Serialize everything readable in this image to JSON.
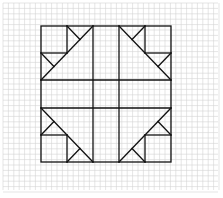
{
  "figure": {
    "background": "#ffffff",
    "grid_color": "#d4d4d4",
    "line_color": "#111111",
    "grid_spacing": 5.4
  },
  "block": {
    "outer": {
      "x1": 41,
      "y1": 26,
      "x2": 171,
      "y2": 162
    },
    "columns": [
      41,
      67,
      93,
      119,
      145,
      171
    ],
    "rows": [
      26,
      53,
      80,
      108,
      135,
      162
    ]
  }
}
